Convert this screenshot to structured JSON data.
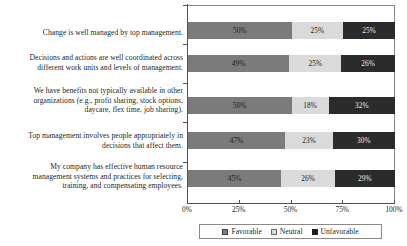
{
  "chart_data": {
    "type": "bar",
    "orientation": "horizontal",
    "stacked": true,
    "normalized_percent": true,
    "title": "",
    "subtitle": "",
    "xlabel": "",
    "ylabel": "",
    "xlim": [
      0,
      100
    ],
    "grid": false,
    "legend_position": "bottom-center",
    "categories": [
      "Change is well managed by top management.",
      "Decisions and actions are well coordinated across different work units and levels of management.",
      "We have benefits not typically available in other organizations (e.g., profit sharing, stock options, daycare, flex time, job sharing).",
      "Top management involves people appropriately in decisions that affect them.",
      "My company has effective human resource management systems and practices for selecting, training, and compensating employees."
    ],
    "category_lines": [
      [
        "Change is well managed by top management."
      ],
      [
        "Decisions and actions are well coordinated across",
        "different work units and levels of management."
      ],
      [
        "We have benefits not typically available in other",
        "organizations (e.g., profit sharing, stock options,",
        "daycare, flex time, job sharing)."
      ],
      [
        "Top management involves people appropriately in",
        "decisions that affect them."
      ],
      [
        "My company has effective human resource",
        "management systems and practices for selecting,",
        "training, and compensating employees."
      ]
    ],
    "series": [
      {
        "name": "Favorable",
        "color": "#7b7b7b",
        "values": [
          50,
          49,
          50,
          47,
          45
        ]
      },
      {
        "name": "Neutral",
        "color": "#dadada",
        "values": [
          25,
          25,
          18,
          23,
          26
        ]
      },
      {
        "name": "Unfavorable",
        "color": "#2b2b2b",
        "values": [
          25,
          26,
          32,
          30,
          29
        ]
      }
    ],
    "data_labels": [
      [
        "50%",
        "25%",
        "25%"
      ],
      [
        "49%",
        "25%",
        "26%"
      ],
      [
        "50%",
        "18%",
        "32%"
      ],
      [
        "47%",
        "23%",
        "30%"
      ],
      [
        "45%",
        "26%",
        "29%"
      ]
    ],
    "xticks": [
      0,
      25,
      50,
      75,
      100
    ],
    "xtick_labels": [
      "0%",
      "25%",
      "50%",
      "75%",
      "100%"
    ]
  },
  "legend": {
    "items": [
      {
        "label": "Favorable",
        "swatch": "favorable-swatch"
      },
      {
        "label": "Neutral",
        "swatch": "neutral-swatch"
      },
      {
        "label": "Unfavorable",
        "swatch": "unfavorable-swatch"
      }
    ]
  }
}
